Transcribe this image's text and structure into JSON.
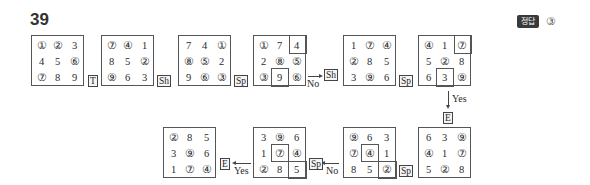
{
  "question": {
    "number": "39"
  },
  "answer": {
    "badge": "정답",
    "value": "③"
  },
  "grids": [
    {
      "cells": [
        "①",
        "②",
        "3",
        "4",
        "5",
        "⑥",
        "⑦",
        "8",
        "9"
      ]
    },
    {
      "cells": [
        "⑦",
        "④",
        "1",
        "8",
        "5",
        "②",
        "⑨",
        "6",
        "3"
      ]
    },
    {
      "cells": [
        "7",
        "4",
        "①",
        "⑧",
        "⑤",
        "2",
        "9",
        "⑥",
        "③"
      ]
    },
    {
      "cells": [
        "①",
        "7",
        "4",
        "2",
        "⑧",
        "⑤",
        "③",
        "9",
        "⑥"
      ]
    },
    {
      "cells": [
        "1",
        "⑦",
        "④",
        "②",
        "8",
        "5",
        "3",
        "⑨",
        "6"
      ]
    },
    {
      "cells": [
        "④",
        "1",
        "⑦",
        "5",
        "②",
        "8",
        "6",
        "3",
        "⑨"
      ]
    },
    {
      "cells": [
        "6",
        "3",
        "⑨",
        "④",
        "1",
        "⑦",
        "5",
        "②",
        "8"
      ]
    },
    {
      "cells": [
        "⑨",
        "6",
        "3",
        "⑦",
        "④",
        "1",
        "8",
        "5",
        "②"
      ]
    },
    {
      "cells": [
        "3",
        "⑨",
        "6",
        "1",
        "⑦",
        "④",
        "②",
        "8",
        "5"
      ]
    },
    {
      "cells": [
        "②",
        "8",
        "5",
        "3",
        "⑨",
        "6",
        "1",
        "⑦",
        "④"
      ]
    }
  ],
  "ops": {
    "t": "T",
    "sh1": "Sh",
    "sp1": "Sp",
    "sh2": "Sh",
    "sp2": "Sp",
    "e1": "E",
    "sp3": "Sp",
    "sp4": "Sp",
    "e2": "E"
  },
  "labels": {
    "no1": "No",
    "yes1": "Yes",
    "no2": "No",
    "yes2": "Yes"
  }
}
